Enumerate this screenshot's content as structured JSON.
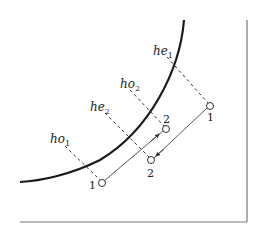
{
  "diagram": {
    "labels": {
      "he1": {
        "base": "he",
        "sub": "1"
      },
      "ho2": {
        "base": "ho",
        "sub": "2"
      },
      "he2": {
        "base": "he",
        "sub": "2"
      },
      "ho1": {
        "base": "ho",
        "sub": "1"
      }
    },
    "points": {
      "p_outer_1": "1",
      "p_inner_2": "2",
      "p_outer_2": "2",
      "p_inner_1": "1"
    },
    "colors": {
      "curve": "#1a1a1a",
      "frame": "#777777",
      "path": "#444444",
      "dashed": "#333333"
    }
  }
}
